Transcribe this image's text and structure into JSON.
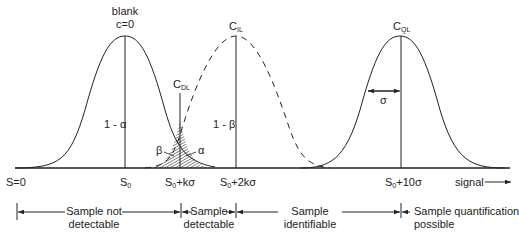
{
  "curves": {
    "blank": {
      "label_line1": "blank",
      "label_line2": "c=0",
      "inner_label": "1 - α"
    },
    "detection": {
      "label": "C",
      "sub": "DL"
    },
    "identification": {
      "label": "C",
      "sub": "IL",
      "inner_label": "1 - β"
    },
    "quantification": {
      "label": "C",
      "sub": "QL",
      "sigma_label": "σ"
    }
  },
  "error_labels": {
    "beta": "β",
    "alpha": "α"
  },
  "axis": {
    "ticks": [
      {
        "main": "S=0",
        "sub": "",
        "rest": ""
      },
      {
        "main": "S",
        "sub": "0",
        "rest": ""
      },
      {
        "main": "S",
        "sub": "0",
        "rest": "+kσ"
      },
      {
        "main": "S",
        "sub": "0",
        "rest": "+2kσ"
      },
      {
        "main": "S",
        "sub": "0",
        "rest": "+10σ"
      }
    ],
    "signal_label": "signal"
  },
  "ranges": [
    {
      "line1": "Sample not",
      "line2": "detectable"
    },
    {
      "line1": "Sample",
      "line2": "detectable"
    },
    {
      "line1": "Sample",
      "line2": "identifiable"
    },
    {
      "line1": "Sample quantification",
      "line2": "possible"
    }
  ]
}
